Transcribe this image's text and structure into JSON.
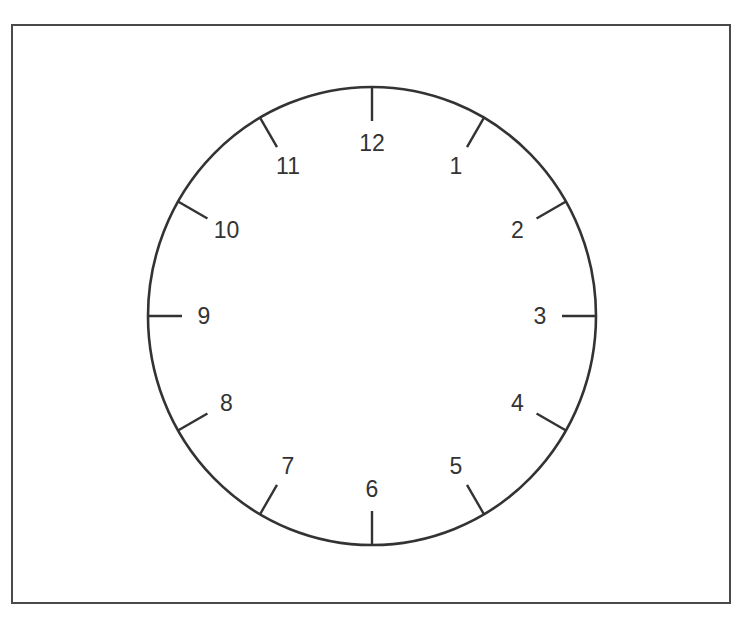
{
  "diagram": {
    "type": "clock-face",
    "frame": {
      "x": 11,
      "y": 24,
      "width": 720,
      "height": 580,
      "stroke": "#4a4a4a"
    },
    "face": {
      "cx": 372,
      "cy": 316,
      "rx": 224,
      "ry": 229,
      "stroke": "#333333",
      "fill": "#ffffff"
    },
    "tick_length": 34,
    "numerals": [
      {
        "label": "12",
        "hour": 12
      },
      {
        "label": "1",
        "hour": 1
      },
      {
        "label": "2",
        "hour": 2
      },
      {
        "label": "3",
        "hour": 3
      },
      {
        "label": "4",
        "hour": 4
      },
      {
        "label": "5",
        "hour": 5
      },
      {
        "label": "6",
        "hour": 6
      },
      {
        "label": "7",
        "hour": 7
      },
      {
        "label": "8",
        "hour": 8
      },
      {
        "label": "9",
        "hour": 9
      },
      {
        "label": "10",
        "hour": 10
      },
      {
        "label": "11",
        "hour": 11
      }
    ],
    "hands": "none"
  }
}
